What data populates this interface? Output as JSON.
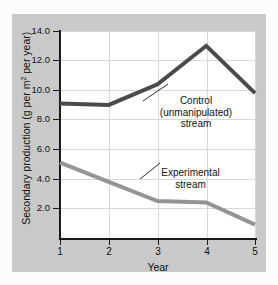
{
  "figure": {
    "background_color": "#c9c9c9",
    "plot_background_color": "#ffffff",
    "grid_color": "#d8d8d8",
    "axis_color": "#1a1a1a"
  },
  "axes": {
    "x_title": "Year",
    "y_title_prefix": "Secondary production (g per m",
    "y_title_superscript": "2",
    "y_title_suffix": " per year)",
    "y_tick_labels": [
      "14.0",
      "12.0",
      "10.0",
      "8.0",
      "6.0",
      "4.0",
      "2.0"
    ],
    "x_tick_labels": [
      "1",
      "2",
      "3",
      "4",
      "5"
    ]
  },
  "annotations": {
    "control_line1": "Control",
    "control_line2": "(unmanipulated)",
    "control_line3": "stream",
    "experimental_line1": "Experimental",
    "experimental_line2": "stream"
  },
  "chart_data": {
    "type": "line",
    "title": "",
    "xlabel": "Year",
    "ylabel": "Secondary production (g per m2 per year)",
    "x": [
      1,
      2,
      3,
      4,
      5
    ],
    "xlim": [
      1,
      5
    ],
    "ylim": [
      0,
      14
    ],
    "yticks": [
      2.0,
      4.0,
      6.0,
      8.0,
      10.0,
      12.0,
      14.0
    ],
    "grid": true,
    "legend": "inline-annotations",
    "series": [
      {
        "name": "Control (unmanipulated) stream",
        "values": [
          9.1,
          9.0,
          10.4,
          13.0,
          9.8
        ],
        "color": "#4a4a4a",
        "width": 4
      },
      {
        "name": "Experimental stream",
        "values": [
          5.1,
          3.8,
          2.5,
          2.4,
          0.9
        ],
        "color": "#949494",
        "width": 4
      }
    ]
  }
}
